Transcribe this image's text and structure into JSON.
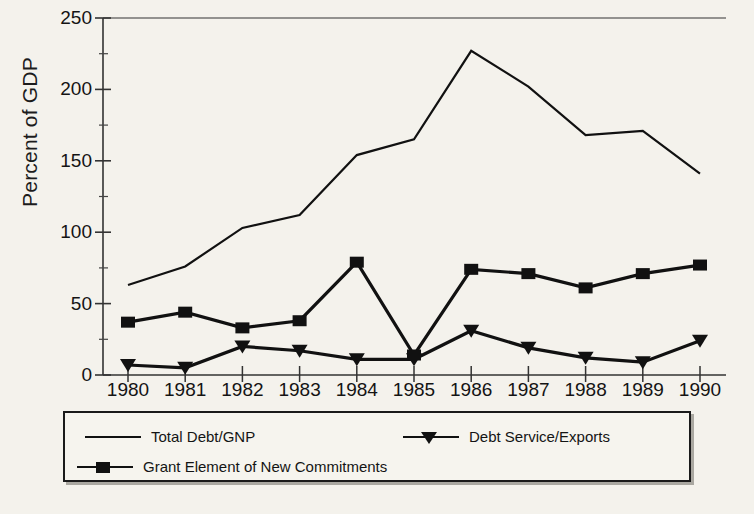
{
  "chart_data": {
    "type": "line",
    "title": "",
    "xlabel": "",
    "ylabel": "Percent of GDP",
    "categories": [
      1980,
      1981,
      1982,
      1983,
      1984,
      1985,
      1986,
      1987,
      1988,
      1989,
      1990
    ],
    "xtick_labels": [
      "1980",
      "1981",
      "1982",
      "1983",
      "1984",
      "1985",
      "1986",
      "1987",
      "1988",
      "1989",
      "1990"
    ],
    "ytick_labels": [
      "0",
      "50",
      "100",
      "150",
      "200",
      "250"
    ],
    "yticks": [
      0,
      50,
      100,
      150,
      200,
      250
    ],
    "yminor": [
      25,
      75,
      125,
      175,
      225
    ],
    "ylim": [
      0,
      250
    ],
    "xlim": [
      1980,
      1990
    ],
    "grid": false,
    "legend_position": "below-plot",
    "series": [
      {
        "name": "Total Debt/GNP",
        "marker": "none",
        "color": "#111111",
        "values": [
          63,
          76,
          103,
          112,
          154,
          165,
          227,
          202,
          168,
          171,
          141
        ]
      },
      {
        "name": "Debt Service/Exports",
        "marker": "triangle-down",
        "color": "#111111",
        "values": [
          7,
          5,
          20,
          17,
          11,
          11,
          31,
          19,
          12,
          9,
          24
        ]
      },
      {
        "name": "Grant Element of New Commitments",
        "marker": "square",
        "color": "#111111",
        "values": [
          37,
          44,
          33,
          38,
          79,
          14,
          74,
          71,
          61,
          71,
          77
        ]
      }
    ]
  },
  "legend": {
    "entries": [
      {
        "label": "Total Debt/GNP",
        "marker": "line"
      },
      {
        "label": "Debt Service/Exports",
        "marker": "triangle-down"
      },
      {
        "label": "Grant Element of New Commitments",
        "marker": "square"
      }
    ]
  },
  "axis": {
    "y_axis_title": "Percent of GDP"
  }
}
